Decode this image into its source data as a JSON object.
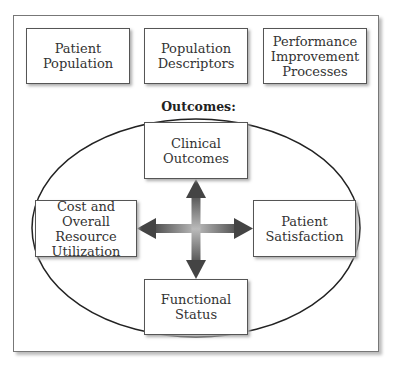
{
  "top_boxes": [
    {
      "label": "Patient\nPopulation"
    },
    {
      "label": "Population\nDescriptors"
    },
    {
      "label": "Performance\nImprovement\nProcesses"
    }
  ],
  "outcomes": {
    "title": "Outcomes:",
    "boxes": {
      "top": {
        "label": "Clinical\nOutcomes"
      },
      "left": {
        "label": "Cost and Overall\nResource\nUtilization"
      },
      "right": {
        "label": "Patient\nSatisfaction"
      },
      "bottom": {
        "label": "Functional\nStatus"
      }
    }
  },
  "arrow": {
    "type": "four-way",
    "color": "#555555"
  }
}
